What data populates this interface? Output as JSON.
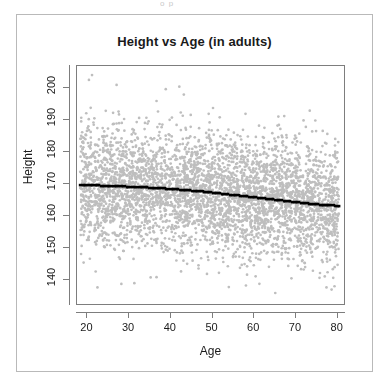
{
  "figure": {
    "title": "Height vs Age (in adults)",
    "top_artifact_text": "o p",
    "frame_color": "#b9b9b9",
    "axis_color": "#7d7d7d",
    "background": "#ffffff"
  },
  "chart_data": {
    "type": "scatter",
    "title": "Height vs Age (in adults)",
    "xlabel": "Age",
    "ylabel": "Height",
    "xlim": [
      17.5,
      82.0
    ],
    "ylim": [
      132.0,
      207.0
    ],
    "grid": false,
    "legend": null,
    "point_color": "#bebebe",
    "trend_color": "#000000",
    "xticks": [
      20,
      30,
      40,
      50,
      60,
      70,
      80
    ],
    "xtick_labels": [
      "20",
      "30",
      "40",
      "50",
      "60",
      "70",
      "80"
    ],
    "yticks": [
      140,
      150,
      160,
      170,
      180,
      190,
      200
    ],
    "ytick_labels": [
      "140",
      "150",
      "160",
      "170",
      "180",
      "190",
      "200"
    ],
    "n_points": 4200,
    "x_data_range": [
      18.5,
      80.5
    ],
    "y_mean_at_x_min": 169.6,
    "y_sd": 9.2,
    "series": [
      {
        "name": "observations",
        "type": "scatter",
        "marker": "circle",
        "color": "#bebebe"
      },
      {
        "name": "fitted mean height",
        "type": "line",
        "marker": "square",
        "color": "#000000",
        "x": [
          18.5,
          20,
          22,
          24,
          26,
          28,
          30,
          32,
          34,
          36,
          38,
          40,
          42,
          44,
          46,
          48,
          50,
          52,
          54,
          56,
          58,
          60,
          62,
          64,
          66,
          68,
          70,
          72,
          74,
          76,
          78,
          80.5
        ],
        "values": [
          169.6,
          169.5,
          169.4,
          169.3,
          169.2,
          169.1,
          169.0,
          168.9,
          168.8,
          168.6,
          168.5,
          168.3,
          168.1,
          167.9,
          167.7,
          167.5,
          167.2,
          166.9,
          166.6,
          166.3,
          166.0,
          165.7,
          165.4,
          165.1,
          164.8,
          164.5,
          164.2,
          163.9,
          163.6,
          163.4,
          163.2,
          163.0
        ]
      }
    ]
  }
}
